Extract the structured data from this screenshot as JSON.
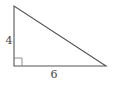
{
  "diagram": {
    "type": "right-triangle",
    "vertices": {
      "top": [
        14,
        6
      ],
      "right_angle": [
        14,
        66
      ],
      "bottom_right": [
        106,
        66
      ]
    },
    "right_angle_marker_size": 8,
    "labels": {
      "vertical_side": "4",
      "horizontal_side": "6"
    },
    "colors": {
      "stroke": "#555555",
      "label": "#444444",
      "background": "#ffffff"
    }
  }
}
